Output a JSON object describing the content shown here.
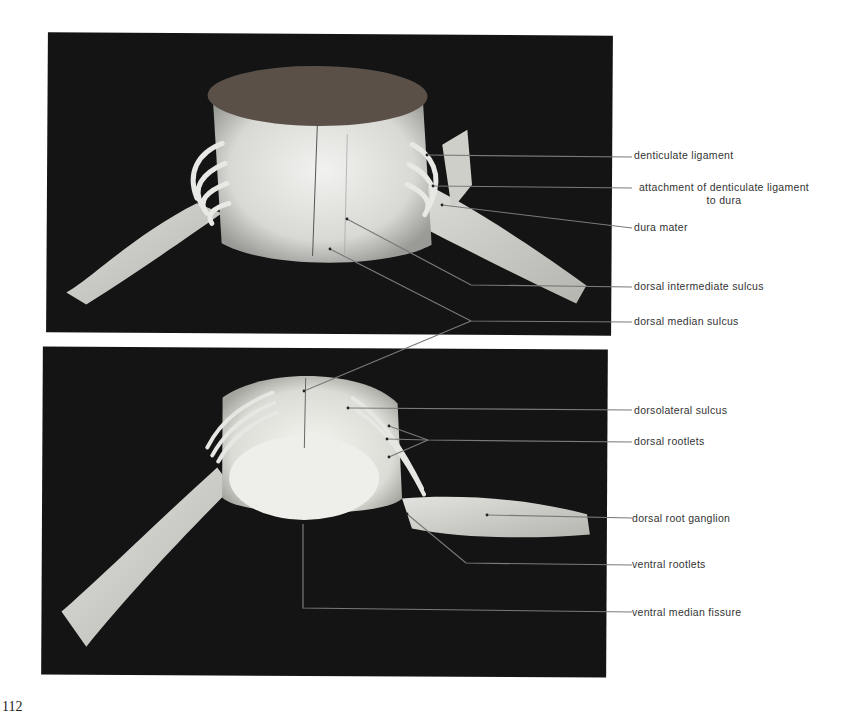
{
  "page": {
    "number": "112"
  },
  "figures": {
    "top": {
      "description": "Dorsal view of spinal cord segment with dura reflected",
      "labels": [
        {
          "id": "denticulate-ligament",
          "text": "denticulate ligament"
        },
        {
          "id": "attachment-denticulate",
          "text": "attachment of denticulate ligament",
          "text2": "to dura"
        },
        {
          "id": "dura-mater",
          "text": "dura mater"
        },
        {
          "id": "dorsal-intermediate-sulcus",
          "text": "dorsal intermediate sulcus"
        },
        {
          "id": "dorsal-median-sulcus",
          "text": "dorsal median sulcus"
        }
      ]
    },
    "bottom": {
      "description": "Oblique view of spinal cord segment showing roots and ganglion",
      "labels": [
        {
          "id": "dorsolateral-sulcus",
          "text": "dorsolateral sulcus"
        },
        {
          "id": "dorsal-rootlets",
          "text": "dorsal rootlets"
        },
        {
          "id": "dorsal-root-ganglion",
          "text": "dorsal root ganglion"
        },
        {
          "id": "ventral-rootlets",
          "text": "ventral rootlets"
        },
        {
          "id": "ventral-median-fissure",
          "text": "ventral median fissure"
        }
      ]
    }
  },
  "colors": {
    "photo_background": "#141414",
    "leader_line": "#7a7a7a",
    "label_text": "#333333"
  }
}
